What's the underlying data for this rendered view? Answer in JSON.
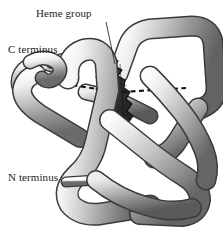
{
  "figure": {
    "background_color": "#ffffff",
    "width": 223,
    "height": 231,
    "labels": {
      "heme_group": "Heme group",
      "c_terminus": "C terminus",
      "n_terminus": "N terminus"
    },
    "label_color": "#232323",
    "leaders": {
      "heme_leader": "line-from-heme-label-to-heme-group"
    },
    "colors": {
      "ribbon_light": "#fbfbfb",
      "ribbon_mid": "#b9b9b9",
      "ribbon_dark": "#6e6e6e",
      "ribbon_outline": "#3d3d3d",
      "heme_fill": "#3a3a3a",
      "heme_edge": "#141414",
      "iron_atom": "#e9e9e9",
      "bond_dash": "#101010"
    },
    "elements": {
      "ribbon": "coiled-polypeptide-backbone-tube",
      "heme": "porphyrin-ring-edge-on",
      "iron": "central-iron-atom",
      "bonds": "dashed-coordination-bonds"
    }
  }
}
